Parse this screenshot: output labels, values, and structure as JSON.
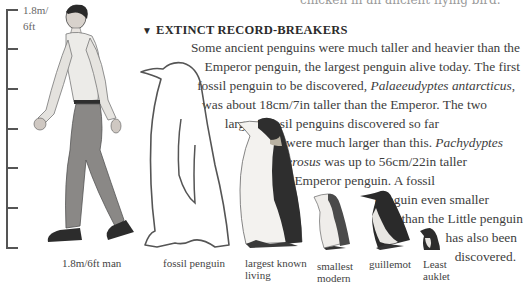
{
  "top_cutoff_text": "chicken in an ancient flying bird.",
  "section": {
    "marker": "▼",
    "heading": "EXTINCT RECORD-BREAKERS"
  },
  "body_lines": [
    {
      "text": "Some ancient penguins were much taller and heavier than the"
    },
    {
      "text": "Emperor penguin, the largest penguin alive today. The first"
    },
    {
      "pre": "fossil penguin to be discovered, ",
      "italic": "Palaeeudyptes antarcticus",
      "post": ","
    },
    {
      "text": "was about 18cm/7in taller than the Emperor. The two"
    },
    {
      "text": "largest fossil penguins discovered so far"
    },
    {
      "pre": "were much larger than this. ",
      "italic": "Pachydyptes",
      "post": ""
    },
    {
      "pre": "",
      "italic": "ponderosus",
      "post": " was up to 56cm/22in taller"
    },
    {
      "text": "than the Emperor penguin. A fossil"
    },
    {
      "text": "penguin even smaller"
    },
    {
      "text": "than the Little penguin"
    },
    {
      "text": "has also been"
    },
    {
      "text": "discovered."
    }
  ],
  "scale": {
    "label_line1": "1.8m/",
    "label_line2": "6ft",
    "tick_count": 7
  },
  "figures": [
    {
      "id": "man",
      "caption": "1.8m/6ft man"
    },
    {
      "id": "fossil",
      "caption": "fossil penguin"
    },
    {
      "id": "emperor",
      "caption_line1": "largest known",
      "caption_line2": "living"
    },
    {
      "id": "little",
      "caption_line1": "smallest",
      "caption_line2": "modern"
    },
    {
      "id": "guillemot",
      "caption": "guillemot"
    },
    {
      "id": "auklet",
      "caption_line1": "Least",
      "caption_line2": "auklet"
    }
  ],
  "colors": {
    "text": "#3d3d3d",
    "heading": "#2b2b2b",
    "ruler": "#555555",
    "background": "#ffffff"
  }
}
